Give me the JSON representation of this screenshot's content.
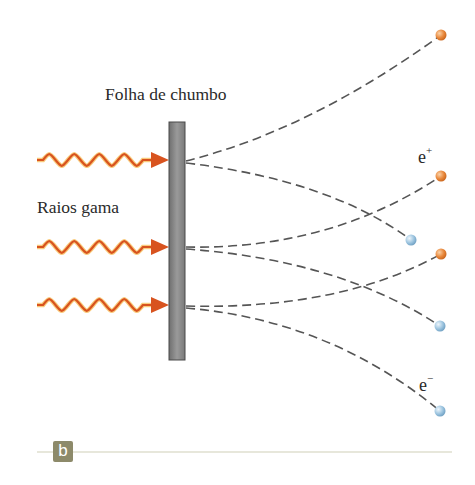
{
  "diagram": {
    "labels": {
      "foil": "Folha de chumbo",
      "gamma_rays": "Raios gama",
      "positron_base": "e",
      "positron_sup": "+",
      "electron_base": "e",
      "electron_sup": "−"
    },
    "panel_label": "b",
    "colors": {
      "wave": "#d8531f",
      "wave_glow": "#f5a623",
      "foil_fill": "#8a8a8a",
      "foil_edge": "#4a4a4a",
      "dash": "#555555",
      "positron": "#e8873a",
      "electron": "#9cc4df",
      "panel_line": "#cfcfb8",
      "panel_badge": "#8d8a6a"
    },
    "foil": {
      "x": 169,
      "y": 122,
      "width": 16,
      "height": 238
    },
    "gamma_rays": [
      {
        "y": 160,
        "x_start": 37,
        "x_tip": 169
      },
      {
        "y": 247,
        "x_start": 37,
        "x_tip": 169
      },
      {
        "y": 305,
        "x_start": 37,
        "x_tip": 169
      }
    ],
    "tracks": [
      {
        "from": [
          186,
          161
        ],
        "ctrl": [
          310,
          130
        ],
        "to": [
          441,
          35
        ],
        "particle": "positron"
      },
      {
        "from": [
          186,
          163
        ],
        "ctrl": [
          330,
          180
        ],
        "to": [
          411,
          240
        ],
        "particle": "electron"
      },
      {
        "from": [
          186,
          247
        ],
        "ctrl": [
          330,
          250
        ],
        "to": [
          441,
          176
        ],
        "particle": "positron",
        "tag": "e+"
      },
      {
        "from": [
          186,
          249
        ],
        "ctrl": [
          340,
          260
        ],
        "to": [
          440,
          326
        ],
        "particle": "electron"
      },
      {
        "from": [
          186,
          306
        ],
        "ctrl": [
          340,
          310
        ],
        "to": [
          441,
          254
        ],
        "particle": "positron"
      },
      {
        "from": [
          186,
          308
        ],
        "ctrl": [
          330,
          320
        ],
        "to": [
          440,
          411
        ],
        "particle": "electron",
        "tag": "e-"
      }
    ]
  }
}
